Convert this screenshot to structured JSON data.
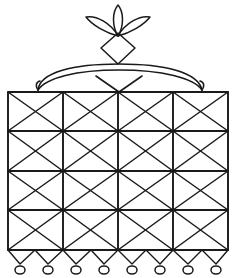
{
  "figure": {
    "type": "line-drawing",
    "canvas": {
      "width": 237,
      "height": 278,
      "background": "#ffffff"
    },
    "stroke_color": "#1a1a1a"
  },
  "ornament": {
    "name": "three-petal floral finial",
    "petal_count": 3,
    "petals": [
      {
        "label": "left-petal",
        "tip_x": 92,
        "tip_y": 18,
        "angle_deg": -38
      },
      {
        "label": "center-petal",
        "tip_x": 118,
        "tip_y": 5,
        "angle_deg": 0
      },
      {
        "label": "right-petal",
        "tip_x": 145,
        "tip_y": 18,
        "angle_deg": 38
      }
    ],
    "junction": {
      "x": 118,
      "y": 36
    },
    "diamond": {
      "cx": 118,
      "cy": 48,
      "half_width": 17,
      "half_height": 16
    }
  },
  "handle": {
    "name": "arched carry handle",
    "left_x": 38,
    "right_x": 202,
    "apex_y": 68,
    "base_y": 90,
    "thickness": 6,
    "inner_chevron": {
      "left_x": 96,
      "right_x": 142,
      "top_y": 76,
      "point_x": 119,
      "point_y": 90
    }
  },
  "body": {
    "name": "woven basket body",
    "left": 8,
    "right": 228,
    "top": 92,
    "bottom": 250,
    "columns": 4,
    "rows": 4,
    "column_edges": [
      8,
      63,
      118,
      173,
      228
    ],
    "row_edges": [
      92,
      131,
      171,
      210,
      250
    ],
    "cell_pattern": "crossed-diagonals"
  },
  "fringe": {
    "name": "sawtooth fringe",
    "top_y": 250,
    "point_y": 264,
    "teeth": 8,
    "left": 8,
    "right": 228
  },
  "beads": {
    "name": "bead row",
    "count": 8,
    "cy": 270,
    "positions": [
      20,
      48,
      76,
      104,
      132,
      160,
      188,
      216
    ],
    "radius_x": 5,
    "radius_y": 4
  }
}
